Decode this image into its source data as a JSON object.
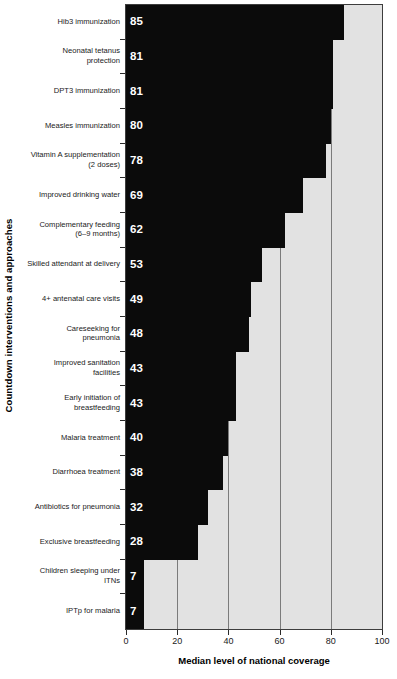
{
  "chart_data": {
    "type": "bar",
    "orientation": "horizontal",
    "title": "",
    "xlabel": "Median level of national coverage",
    "ylabel": "Countdown interventions and approaches",
    "xlim": [
      0,
      100
    ],
    "xticks": [
      0,
      20,
      40,
      60,
      80,
      100
    ],
    "xticklabels": [
      "0",
      "20",
      "40",
      "60",
      "80",
      "100"
    ],
    "grid": "vertical",
    "legend": "none",
    "categories": [
      "Hib3 immunization",
      "Neonatal tetanus protection",
      "DPT3 immunization",
      "Measles immunization",
      "Vitamin A supplementation (2 doses)",
      "Improved drinking water",
      "Complementary feeding (6–9 months)",
      "Skilled attendant at delivery",
      "4+ antenatal care visits",
      "Careseeking for pneumonia",
      "Improved sanitation facilities",
      "Early initiation of breastfeeding",
      "Malaria treatment",
      "Diarrhoea treatment",
      "Antibiotics for pneumonia",
      "Exclusive breastfeeding",
      "Children sleeping under ITNs",
      "IPTp for malaria"
    ],
    "values": [
      85,
      81,
      81,
      80,
      78,
      69,
      62,
      53,
      49,
      48,
      43,
      43,
      40,
      38,
      32,
      28,
      7,
      7
    ],
    "value_labels": [
      "85",
      "81",
      "81",
      "80",
      "78",
      "69",
      "62",
      "53",
      "49",
      "48",
      "43",
      "43",
      "40",
      "38",
      "32",
      "28",
      "7",
      "7"
    ],
    "colors": {
      "bar": "#0b0b0b",
      "plot_background": "#e2e2e2",
      "gridline": "#7b7b7b",
      "axis": "#3d3d3d",
      "value_text": "#ffffff",
      "label_text": "#1a1a1a"
    }
  },
  "category_lines": [
    [
      "Hib3 immunization"
    ],
    [
      "Neonatal tetanus",
      "protection"
    ],
    [
      "DPT3 immunization"
    ],
    [
      "Measles immunization"
    ],
    [
      "Vitamin A supplementation",
      "(2 doses)"
    ],
    [
      "Improved drinking water"
    ],
    [
      "Complementary feeding",
      "(6–9 months)"
    ],
    [
      "Skilled attendant at delivery"
    ],
    [
      "4+ antenatal care visits"
    ],
    [
      "Careseeking for",
      "pneumonia"
    ],
    [
      "Improved sanitation",
      "facilities"
    ],
    [
      "Early initiation of",
      "breastfeeding"
    ],
    [
      "Malaria treatment"
    ],
    [
      "Diarrhoea treatment"
    ],
    [
      "Antibiotics for pneumonia"
    ],
    [
      "Exclusive breastfeeding"
    ],
    [
      "Children sleeping under",
      "ITNs"
    ],
    [
      "IPTp for malaria"
    ]
  ]
}
